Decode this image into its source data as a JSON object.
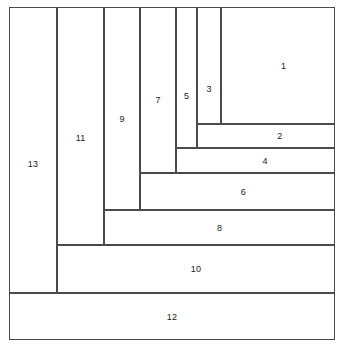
{
  "diagram": {
    "type": "rectangle-dissection",
    "canvas": {
      "width": 339,
      "height": 347
    },
    "bounding_box": {
      "x": 9,
      "y": 7,
      "width": 326,
      "height": 333
    },
    "stroke_color": "#4a4a4a",
    "fill_color": "#ffffff",
    "label_color": "#1a1a1a",
    "vertical_gridlines": [
      9,
      57,
      104,
      140,
      176,
      197,
      221,
      335
    ],
    "horizontal_gridlines": [
      7,
      124,
      148,
      173,
      210,
      245,
      293,
      340
    ],
    "cells": [
      {
        "label": "1",
        "x": 221,
        "y": 7,
        "width": 114,
        "height": 117,
        "label_x": 0.55,
        "label_y": 0.5
      },
      {
        "label": "2",
        "x": 197,
        "y": 124,
        "width": 138,
        "height": 24,
        "label_x": 0.6,
        "label_y": 0.5
      },
      {
        "label": "3",
        "x": 197,
        "y": 7,
        "width": 24,
        "height": 117,
        "label_x": 0.5,
        "label_y": 0.7
      },
      {
        "label": "4",
        "x": 176,
        "y": 148,
        "width": 159,
        "height": 25,
        "label_x": 0.56,
        "label_y": 0.5
      },
      {
        "label": "5",
        "x": 176,
        "y": 7,
        "width": 21,
        "height": 141,
        "label_x": 0.5,
        "label_y": 0.63
      },
      {
        "label": "6",
        "x": 140,
        "y": 173,
        "width": 195,
        "height": 37,
        "label_x": 0.53,
        "label_y": 0.5
      },
      {
        "label": "7",
        "x": 140,
        "y": 7,
        "width": 36,
        "height": 166,
        "label_x": 0.5,
        "label_y": 0.56
      },
      {
        "label": "8",
        "x": 104,
        "y": 210,
        "width": 231,
        "height": 35,
        "label_x": 0.5,
        "label_y": 0.5
      },
      {
        "label": "9",
        "x": 104,
        "y": 7,
        "width": 36,
        "height": 203,
        "label_x": 0.5,
        "label_y": 0.55
      },
      {
        "label": "10",
        "x": 57,
        "y": 245,
        "width": 278,
        "height": 48,
        "label_x": 0.5,
        "label_y": 0.5
      },
      {
        "label": "11",
        "x": 57,
        "y": 7,
        "width": 47,
        "height": 238,
        "label_x": 0.5,
        "label_y": 0.55
      },
      {
        "label": "12",
        "x": 9,
        "y": 293,
        "width": 326,
        "height": 47,
        "label_x": 0.5,
        "label_y": 0.5
      },
      {
        "label": "13",
        "x": 9,
        "y": 7,
        "width": 48,
        "height": 286,
        "label_x": 0.5,
        "label_y": 0.55
      }
    ]
  }
}
